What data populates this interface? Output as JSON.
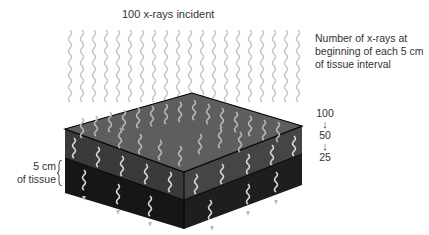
{
  "title": "100 x-rays incident",
  "legend": {
    "lines": [
      "Number of x-rays at",
      "beginning of each 5 cm",
      "of tissue interval"
    ]
  },
  "counts": {
    "values": [
      "100",
      "50",
      "25"
    ],
    "arrow_glyph": "↓"
  },
  "tissue_label": {
    "lines": [
      "5 cm",
      "of tissue"
    ]
  },
  "colors": {
    "wave_incident": "#c4c4c4",
    "wave_in_tissue": "#d8d8d8",
    "top_face": "#5e5e5e",
    "upper_layer_left": "#3a3a3a",
    "upper_layer_right": "#454545",
    "lower_layer_left": "#161616",
    "lower_layer_right": "#1e1e1e",
    "edge": "#000000"
  },
  "diagram": {
    "box": {
      "top_left": [
        65,
        129
      ],
      "top_back": [
        192,
        93
      ],
      "top_right": [
        302,
        126
      ],
      "top_front": [
        184,
        172
      ],
      "layer_depth": 28,
      "total_depth": 57
    },
    "incident_waves_count": 20,
    "layer1_waves_count": 10,
    "exit_waves_count": 8
  }
}
